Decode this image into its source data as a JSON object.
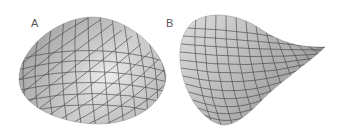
{
  "figure": {
    "panels": [
      {
        "label": "A",
        "surface": "dome",
        "description": "Positively curved dome surface (elliptic)"
      },
      {
        "label": "B",
        "surface": "saddle",
        "description": "Negatively curved saddle surface (hyperbolic)"
      }
    ],
    "colors": {
      "background": "#ffffff",
      "surface_light": "#e6e6e6",
      "surface_dark": "#8c8c8c",
      "grid_line": "#3c3c3c",
      "label": "#555555"
    }
  }
}
